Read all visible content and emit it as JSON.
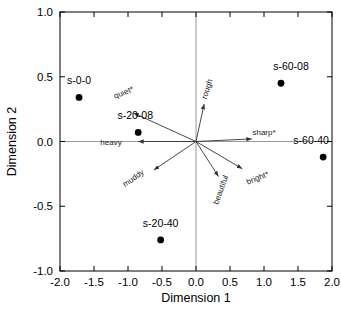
{
  "chart_data": {
    "type": "scatter",
    "title": "",
    "xlabel": "Dimension 1",
    "ylabel": "Dimension 2",
    "xlim": [
      -2.0,
      2.0
    ],
    "ylim": [
      -1.0,
      1.0
    ],
    "xticks": [
      "-2.0",
      "-1.5",
      "-1.0",
      "-0.5",
      "0.0",
      "0.5",
      "1.0",
      "1.5",
      "2.0"
    ],
    "xtick_values": [
      -2.0,
      -1.5,
      -1.0,
      -0.5,
      0.0,
      0.5,
      1.0,
      1.5,
      2.0
    ],
    "yticks": [
      "1.0",
      "0.5",
      "0.0",
      "-0.5",
      "-1.0"
    ],
    "ytick_values": [
      1.0,
      0.5,
      0.0,
      -0.5,
      -1.0
    ],
    "grid": false,
    "legend": "none",
    "points": [
      {
        "label": "s-0-0",
        "x": -1.72,
        "y": 0.34,
        "label_dx": 0,
        "label_dy": -13
      },
      {
        "label": "s-20-08",
        "x": -0.85,
        "y": 0.07,
        "label_dx": -3,
        "label_dy": -13
      },
      {
        "label": "s-20-40",
        "x": -0.52,
        "y": -0.76,
        "label_dx": 0,
        "label_dy": -13
      },
      {
        "label": "s-60-08",
        "x": 1.25,
        "y": 0.45,
        "label_dx": 10,
        "label_dy": -13
      },
      {
        "label": "s-60-40",
        "x": 1.87,
        "y": -0.12,
        "label_dx": -12,
        "label_dy": -13
      }
    ],
    "vectors": [
      {
        "label": "quiet*",
        "x": -0.92,
        "y": 0.22,
        "rot": -22,
        "label_x": -1.05,
        "label_y": 0.36
      },
      {
        "label": "heavy",
        "x": -0.85,
        "y": 0.0,
        "rot": 0,
        "label_x": -1.25,
        "label_y": -0.03
      },
      {
        "label": "muddy",
        "x": -0.62,
        "y": -0.22,
        "rot": -35,
        "label_x": -0.9,
        "label_y": -0.3
      },
      {
        "label": "rough",
        "x": 0.12,
        "y": 0.29,
        "rot": -72,
        "label_x": 0.2,
        "label_y": 0.4
      },
      {
        "label": "sharp*",
        "x": 0.82,
        "y": 0.02,
        "rot": 0,
        "label_x": 1.0,
        "label_y": 0.05
      },
      {
        "label": "bright*",
        "x": 0.68,
        "y": -0.21,
        "rot": -22,
        "label_x": 0.92,
        "label_y": -0.3
      },
      {
        "label": "beautiful",
        "x": 0.33,
        "y": -0.27,
        "rot": -70,
        "label_x": 0.4,
        "label_y": -0.38
      }
    ],
    "colors": {
      "point": "#000000",
      "axis": "#000000",
      "vector": "#333333",
      "zeroline": "#999999"
    }
  }
}
